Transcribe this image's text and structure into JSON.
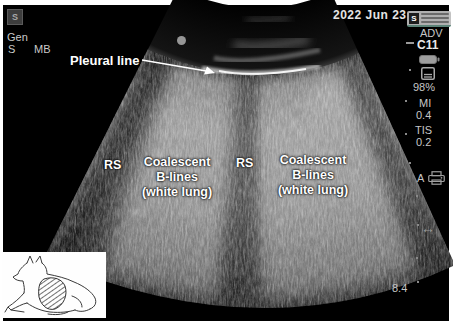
{
  "header": {
    "logo_text": "S",
    "preset": "Gen",
    "mode_left": "S",
    "mode_right": "MB",
    "date": "2022 Jun 23",
    "watermark_logo": "S"
  },
  "sidebar": {
    "mode": "ADV",
    "probe": "C11",
    "battery_percent": "98%",
    "mi_label": "MI",
    "mi_value": "0.4",
    "tis_label": "TIS",
    "tis_value": "0.2",
    "annotation_key": "A",
    "depth_value": "8.4"
  },
  "annotations": {
    "pleural_line": "Pleural line",
    "rs_left": "RS",
    "rs_right": "RS",
    "blines_left": "Coalescent\nB-lines\n(white lung)",
    "blines_right": "Coalescent\nB-lines\n(white lung)"
  },
  "icons": {
    "swap_glyph": "↔",
    "battery": "battery-icon",
    "save": "save-icon",
    "printer": "printer-icon",
    "s_logo": "s-logo-icon"
  },
  "colors": {
    "screen_bg": "#000000",
    "sidebar_text": "#c6c6c6",
    "annotation_text": "#ffffff",
    "watermark_accent": "#5b8377"
  }
}
